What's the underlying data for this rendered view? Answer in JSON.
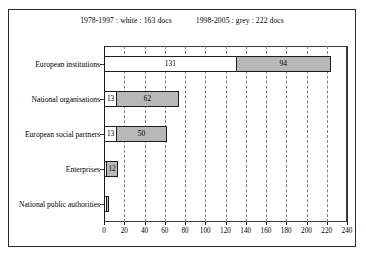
{
  "legend": {
    "entries": [
      {
        "text": "1978-1997 : white : 163 docs"
      },
      {
        "text": "1998-2005 : grey : 222 docs"
      }
    ]
  },
  "axis": {
    "xticks": [
      "0",
      "20",
      "40",
      "60",
      "80",
      "100",
      "120",
      "140",
      "160",
      "180",
      "200",
      "220",
      "240"
    ]
  },
  "categories": [
    {
      "label": "European institutions"
    },
    {
      "label": "National organisations"
    },
    {
      "label": "European social partners"
    },
    {
      "label": "Enterprises"
    },
    {
      "label": "National public authorities"
    }
  ],
  "bars": [
    {
      "white_label": "131",
      "grey_label": "94"
    },
    {
      "white_label": "13",
      "grey_label": "62"
    },
    {
      "white_label": "13",
      "grey_label": "50"
    },
    {
      "white_label": "",
      "grey_label": "12"
    },
    {
      "white_label": "",
      "grey_label": ""
    }
  ],
  "colors": {
    "white_series": "#ffffff",
    "grey_series": "#b8b8b8",
    "outline": "#1d1d1d",
    "grid": "#808080"
  },
  "chart_data": {
    "type": "bar",
    "title": "",
    "subtitle": "",
    "orientation": "horizontal",
    "stacked": true,
    "xlabel": "",
    "ylabel": "",
    "xlim": [
      0,
      240
    ],
    "xticks": [
      0,
      20,
      40,
      60,
      80,
      100,
      120,
      140,
      160,
      180,
      200,
      220,
      240
    ],
    "grid": "vertical-dashed",
    "legend_position": "top-center",
    "categories": [
      "European institutions",
      "National organisations",
      "European social partners",
      "Enterprises",
      "National public authorities"
    ],
    "series": [
      {
        "name": "1978-1997",
        "color": "#ffffff",
        "total": 163,
        "values": [
          131,
          13,
          13,
          2,
          2
        ],
        "value_labels": [
          "131",
          "13",
          "13",
          "",
          ""
        ]
      },
      {
        "name": "1998-2005",
        "color": "#b8b8b8",
        "total": 222,
        "values": [
          94,
          62,
          50,
          12,
          3
        ],
        "value_labels": [
          "94",
          "62",
          "50",
          "12",
          ""
        ]
      }
    ]
  }
}
